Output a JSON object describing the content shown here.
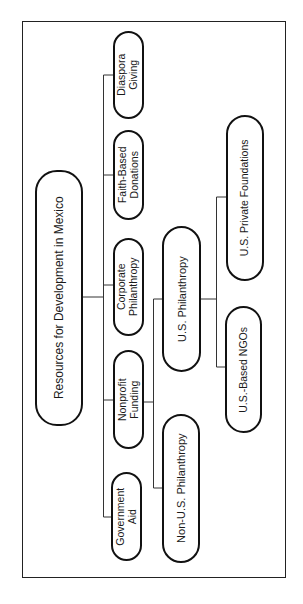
{
  "diagram": {
    "root": {
      "label": "Resources for Development in Mexico"
    },
    "level1": [
      {
        "id": "diaspora",
        "label": "Diaspora\nGiving"
      },
      {
        "id": "faith",
        "label": "Faith-Based\nDonations"
      },
      {
        "id": "corporate",
        "label": "Corporate\nPhilanthropy"
      },
      {
        "id": "nonprofit",
        "label": "Nonprofit\nFunding"
      },
      {
        "id": "government",
        "label": "Government\nAid"
      }
    ],
    "level2": [
      {
        "id": "us_phil",
        "parent": "nonprofit",
        "label": "U.S. Philanthropy"
      },
      {
        "id": "non_us_phil",
        "parent": "nonprofit",
        "label": "Non-U.S. Philanthropy"
      }
    ],
    "level3": [
      {
        "id": "us_private_foundations",
        "parent": "us_phil",
        "label": "U.S. Private Foundations"
      },
      {
        "id": "us_based_ngos",
        "parent": "us_phil",
        "label": "U.S.-Based NGOs"
      }
    ],
    "colors": {
      "stroke": "#111111",
      "connector": "#333333",
      "background": "#ffffff",
      "text": "#1a1a1a"
    }
  }
}
